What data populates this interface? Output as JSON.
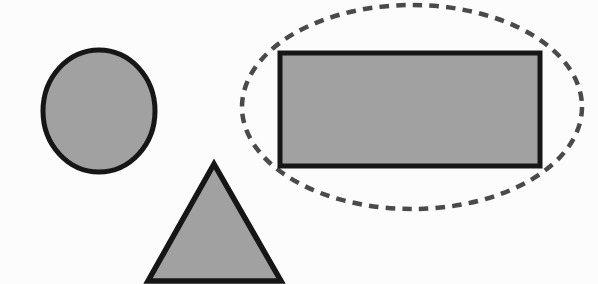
{
  "scene": {
    "description": "Worksheet graphic of plane shapes; the rectangle is enclosed by a dashed oval selection",
    "canvas": {
      "width": 598,
      "height": 284,
      "background_color": "#fcfcfc"
    },
    "colors": {
      "shape_fill": "#a1a1a1",
      "shape_outline": "#161616",
      "dashed_selection": "#4a4a4a"
    },
    "shapes": [
      {
        "name": "dashed-ellipse-outline",
        "label": "dashed oval selection around rectangle",
        "type": "ellipse",
        "interactable": "false",
        "attrs": {
          "cx": 412,
          "cy": 107,
          "rx": 170,
          "ry": 102,
          "fill": "none",
          "stroke": "#4a4a4a",
          "stroke-width": 4.5,
          "stroke-dasharray": "9.5 7.2",
          "stroke-linecap": "butt"
        }
      },
      {
        "name": "rectangle-shape",
        "label": "gray rectangle",
        "type": "rect",
        "interactable": "false",
        "attrs": {
          "x": 280,
          "y": 53,
          "width": 260,
          "height": 113,
          "fill": "#a1a1a1",
          "stroke": "#161616",
          "stroke-width": 5
        }
      },
      {
        "name": "circle-shape",
        "label": "gray circle",
        "type": "ellipse",
        "interactable": "false",
        "attrs": {
          "cx": 99,
          "cy": 111,
          "rx": 56,
          "ry": 61,
          "fill": "#a1a1a1",
          "stroke": "#161616",
          "stroke-width": 5
        }
      },
      {
        "name": "triangle-shape",
        "label": "gray triangle",
        "type": "polygon",
        "interactable": "false",
        "attrs": {
          "points": "214,164 281,281 148,281",
          "fill": "#a1a1a1",
          "stroke": "#161616",
          "stroke-width": 5.5,
          "stroke-linejoin": "miter"
        }
      }
    ]
  }
}
